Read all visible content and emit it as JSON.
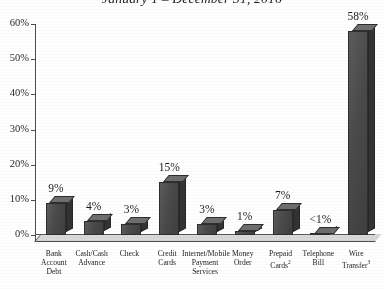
{
  "chart_data": {
    "type": "bar",
    "title": "January 1 – December 31, 2016",
    "title_cut_line": "",
    "xlabel": "",
    "ylabel": "",
    "ylim": [
      0,
      60
    ],
    "ytick_labels": [
      "0%",
      "10%",
      "20%",
      "30%",
      "40%",
      "50%",
      "60%"
    ],
    "ytick_values": [
      0,
      10,
      20,
      30,
      40,
      50,
      60
    ],
    "grid": false,
    "legend": "none",
    "categories": [
      "Bank Account Debt",
      "Cash/Cash Advance",
      "Check",
      "Credit Cards",
      "Internet/Mobile Payment Services",
      "Money Order",
      "Prepaid Cards",
      "Telephone Bill",
      "Wire Transfer"
    ],
    "category_lines": [
      [
        "Bank",
        "Account",
        "Debt"
      ],
      [
        "Cash/Cash",
        "Advance"
      ],
      [
        "Check"
      ],
      [
        "Credit",
        "Cards"
      ],
      [
        "Internet/Mobile",
        "Payment",
        "Services"
      ],
      [
        "Money",
        "Order"
      ],
      [
        "Prepaid",
        "Cards"
      ],
      [
        "Telephone",
        "Bill"
      ],
      [
        "Wire",
        "Transfer"
      ]
    ],
    "category_footnotes": [
      "",
      "",
      "",
      "",
      "",
      "",
      "2",
      "",
      "3"
    ],
    "values": [
      9,
      4,
      3,
      15,
      3,
      1,
      7,
      0.4,
      58
    ],
    "value_labels": [
      "9%",
      "4%",
      "3%",
      "15%",
      "3%",
      "1%",
      "7%",
      "<1%",
      "58%"
    ],
    "colors": {
      "bar_front": "#4a4a4a",
      "bar_side": "#333333",
      "bar_top": "#6e6e6e",
      "axis": "#4d4d4d",
      "text": "#1c1c1c",
      "background": "#ffffff"
    }
  }
}
